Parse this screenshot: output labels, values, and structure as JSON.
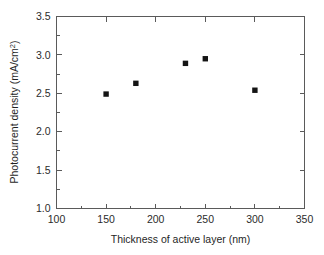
{
  "chart_data": {
    "type": "scatter",
    "title": "",
    "xlabel": "Thickness of active layer (nm)",
    "ylabel": "Photocurrent density (mA/cm2)",
    "ylabel_base": "Photocurrent density (mA/cm",
    "ylabel_sup": "2",
    "ylabel_tail": ")",
    "xlim": [
      100,
      350
    ],
    "ylim": [
      1.0,
      3.5
    ],
    "xticks": [
      100,
      150,
      200,
      250,
      300,
      350
    ],
    "xtick_labels": [
      "100",
      "150",
      "200",
      "250",
      "300",
      "350"
    ],
    "yticks": [
      1.0,
      1.5,
      2.0,
      2.5,
      3.0,
      3.5
    ],
    "ytick_labels": [
      "1.0",
      "1.5",
      "2.0",
      "2.5",
      "3.0",
      "3.5"
    ],
    "x_minor_ticks": [
      125,
      175,
      225,
      275,
      325
    ],
    "y_minor_ticks": [
      1.25,
      1.75,
      2.25,
      2.75,
      3.25
    ],
    "grid": false,
    "legend": false,
    "marker_style": "filled-square",
    "marker_color": "#141414",
    "axis_color": "#5a5a5a",
    "x": [
      150,
      180,
      230,
      250,
      300
    ],
    "y": [
      2.49,
      2.63,
      2.89,
      2.95,
      2.54
    ],
    "points": [
      {
        "x": 150,
        "y": 2.49
      },
      {
        "x": 180,
        "y": 2.63
      },
      {
        "x": 230,
        "y": 2.89
      },
      {
        "x": 250,
        "y": 2.95
      },
      {
        "x": 300,
        "y": 2.54
      }
    ],
    "series": [
      {
        "name": "Photocurrent density",
        "values": [
          2.49,
          2.63,
          2.89,
          2.95,
          2.54
        ]
      }
    ]
  }
}
